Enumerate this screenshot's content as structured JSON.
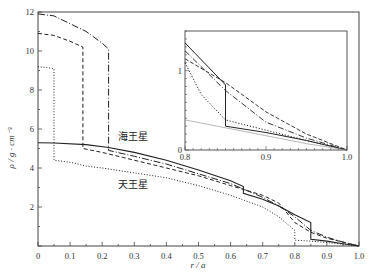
{
  "chart_data": {
    "type": "line",
    "title": "",
    "xlabel": "r / a",
    "ylabel": "ρ / g · cm⁻³",
    "xlim": [
      0,
      1.0
    ],
    "ylim": [
      0,
      12
    ],
    "x_ticks": [
      "0",
      "0.1",
      "0.2",
      "0.3",
      "0.4",
      "0.5",
      "0.6",
      "0.7",
      "0.8",
      "0.9",
      "1.0"
    ],
    "y_ticks": [
      "2",
      "4",
      "6",
      "8",
      "10",
      "12"
    ],
    "grid": false,
    "annotations": [
      {
        "text": "海王星",
        "x": 0.24,
        "y": 5.6
      },
      {
        "text": "天王星",
        "x": 0.24,
        "y": 3.4
      }
    ],
    "series": [
      {
        "name": "solid",
        "style": "solid",
        "x": [
          0,
          0.05,
          0.15,
          0.22,
          0.3,
          0.4,
          0.5,
          0.6,
          0.64,
          0.64,
          0.7,
          0.75,
          0.8,
          0.85,
          0.85,
          0.9,
          0.95,
          1.0
        ],
        "y": [
          5.3,
          5.28,
          5.2,
          5.05,
          4.8,
          4.4,
          3.9,
          3.35,
          3.05,
          2.7,
          2.4,
          2.05,
          1.6,
          1.2,
          0.35,
          0.25,
          0.12,
          0
        ]
      },
      {
        "name": "long-dash-dot",
        "style": "dashdot",
        "x": [
          0,
          0.05,
          0.1,
          0.15,
          0.2,
          0.22,
          0.22,
          0.3,
          0.4,
          0.5,
          0.6,
          0.7,
          0.75,
          0.8,
          0.85,
          0.9,
          0.95,
          1.0
        ],
        "y": [
          11.9,
          11.8,
          11.4,
          11.0,
          10.4,
          10.1,
          4.9,
          4.6,
          4.2,
          3.7,
          3.2,
          2.5,
          2.05,
          1.5,
          0.8,
          0.45,
          0.2,
          0
        ]
      },
      {
        "name": "dashed",
        "style": "dashed",
        "x": [
          0,
          0.05,
          0.1,
          0.14,
          0.14,
          0.2,
          0.3,
          0.4,
          0.5,
          0.6,
          0.64,
          0.7,
          0.75,
          0.8,
          0.85,
          0.9,
          0.95,
          1.0
        ],
        "y": [
          10.9,
          10.8,
          10.5,
          10.2,
          5.0,
          4.8,
          4.4,
          4.0,
          3.6,
          3.1,
          2.9,
          2.6,
          2.2,
          1.2,
          0.7,
          0.4,
          0.2,
          0
        ]
      },
      {
        "name": "dotted",
        "style": "dotted",
        "x": [
          0,
          0.05,
          0.05,
          0.1,
          0.15,
          0.2,
          0.3,
          0.4,
          0.5,
          0.6,
          0.7,
          0.75,
          0.8,
          0.8,
          0.85,
          0.9,
          0.95,
          1.0
        ],
        "y": [
          9.2,
          9.1,
          4.4,
          4.3,
          4.1,
          4.0,
          3.75,
          3.5,
          3.1,
          2.6,
          2.0,
          1.5,
          0.8,
          0.3,
          0.25,
          0.18,
          0.1,
          0
        ]
      }
    ],
    "inset": {
      "xlim": [
        0.8,
        1.0
      ],
      "ylim": [
        0,
        1.5
      ],
      "x_ticks": [
        "0.8",
        "0.9",
        "1.0"
      ],
      "y_ticks": [
        "0",
        "1"
      ],
      "series": [
        {
          "name": "solid",
          "x": [
            0.8,
            0.85,
            0.85,
            0.9,
            0.95,
            1.0
          ],
          "y": [
            1.35,
            0.82,
            0.3,
            0.22,
            0.12,
            0
          ]
        },
        {
          "name": "long-dash-dot",
          "x": [
            0.8,
            0.85,
            0.9,
            0.95,
            1.0
          ],
          "y": [
            1.25,
            0.75,
            0.35,
            0.15,
            0
          ]
        },
        {
          "name": "dashed",
          "x": [
            0.8,
            0.85,
            0.9,
            0.95,
            1.0
          ],
          "y": [
            1.15,
            0.85,
            0.48,
            0.2,
            0
          ]
        },
        {
          "name": "dotted",
          "x": [
            0.8,
            0.82,
            0.85,
            0.9,
            0.95,
            1.0
          ],
          "y": [
            1.1,
            0.7,
            0.38,
            0.25,
            0.12,
            0
          ]
        },
        {
          "name": "thin-gray",
          "x": [
            0.8,
            0.85,
            0.9,
            0.95,
            1.0
          ],
          "y": [
            0.38,
            0.28,
            0.18,
            0.08,
            0
          ]
        }
      ]
    }
  }
}
